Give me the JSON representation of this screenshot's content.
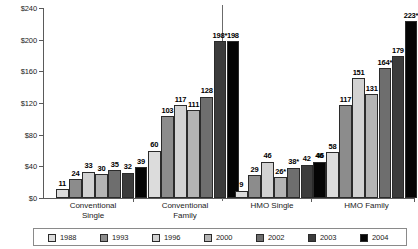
{
  "chart_data": {
    "type": "bar",
    "title": "",
    "xlabel": "",
    "ylabel": "",
    "ylim": [
      0,
      240
    ],
    "grid": false,
    "legend_position": "bottom",
    "y_ticks": [
      "$0",
      "$40",
      "$80",
      "$120",
      "$160",
      "$200",
      "$240"
    ],
    "y_tick_values": [
      0,
      40,
      80,
      120,
      160,
      200,
      240
    ],
    "categories": [
      "Conventional Single",
      "Conventional Family",
      "HMO Single",
      "HMO Family"
    ],
    "category_lines": [
      [
        "Conventional",
        "Single"
      ],
      [
        "Conventional",
        "Family"
      ],
      [
        "HMO Single"
      ],
      [
        "HMO Family"
      ]
    ],
    "series": [
      {
        "name": "1988",
        "color": "#dcdcdc",
        "values": [
          11,
          60,
          9,
          null
        ]
      },
      {
        "name": "1993",
        "color": "#8c8c8c",
        "values": [
          24,
          103,
          29,
          58
        ]
      },
      {
        "name": "1996",
        "color": "#d2d2d2",
        "values": [
          33,
          117,
          46,
          117
        ]
      },
      {
        "name": "2000",
        "color": "#b4b4b4",
        "values": [
          30,
          111,
          26,
          151
        ]
      },
      {
        "name": "2002",
        "color": "#6e6e6e",
        "values": [
          35,
          128,
          38,
          131
        ]
      },
      {
        "name": "2003",
        "color": "#3c3c3c",
        "values": [
          32,
          198,
          42,
          164
        ]
      },
      {
        "name": "2004",
        "color": "#050505",
        "values": [
          39,
          198,
          46,
          179
        ]
      }
    ],
    "extra_bars": [
      {
        "category": "HMO Family",
        "series": "1988",
        "value": 46,
        "label": "46",
        "color": "#050505"
      },
      {
        "category": "HMO Family",
        "series": "2004b",
        "value": 223,
        "label": "223*",
        "color": "#050505"
      }
    ],
    "data_labels": {
      "Conventional Single": [
        "11",
        "24",
        "33",
        "30",
        "35",
        "32",
        "39"
      ],
      "Conventional Family": [
        "60",
        "103",
        "117",
        "111",
        "128",
        "198*",
        "198"
      ],
      "HMO Single": [
        "9",
        "29",
        "46",
        "26*",
        "38*",
        "42",
        "46"
      ],
      "HMO Family": [
        "46",
        "58",
        "117",
        "151",
        "131",
        "164*",
        "179",
        "223*"
      ]
    }
  },
  "legend": {
    "items": [
      {
        "label": "1988",
        "color": "#dcdcdc"
      },
      {
        "label": "1993",
        "color": "#8c8c8c"
      },
      {
        "label": "1996",
        "color": "#d2d2d2"
      },
      {
        "label": "2000",
        "color": "#b4b4b4"
      },
      {
        "label": "2002",
        "color": "#6e6e6e"
      },
      {
        "label": "2003",
        "color": "#3c3c3c"
      },
      {
        "label": "2004",
        "color": "#050505"
      }
    ]
  },
  "axis": {
    "tick_0": "$0",
    "tick_40": "$40",
    "tick_80": "$80",
    "tick_120": "$120",
    "tick_160": "$160",
    "tick_200": "$200",
    "tick_240": "$240"
  },
  "groups": {
    "g0_line1": "Conventional",
    "g0_line2": "Single",
    "g1_line1": "Conventional",
    "g1_line2": "Family",
    "g2_line1": "HMO Single",
    "g3_line1": "HMO Family"
  },
  "bars": {
    "cs": [
      {
        "label": "11",
        "value": 11,
        "color": "#dcdcdc",
        "series": "1988"
      },
      {
        "label": "24",
        "value": 24,
        "color": "#8c8c8c",
        "series": "1993"
      },
      {
        "label": "33",
        "value": 33,
        "color": "#d2d2d2",
        "series": "1996"
      },
      {
        "label": "30",
        "value": 30,
        "color": "#b4b4b4",
        "series": "2000"
      },
      {
        "label": "35",
        "value": 35,
        "color": "#6e6e6e",
        "series": "2002"
      },
      {
        "label": "32",
        "value": 32,
        "color": "#3c3c3c",
        "series": "2003"
      },
      {
        "label": "39",
        "value": 39,
        "color": "#050505",
        "series": "2004"
      }
    ],
    "cf": [
      {
        "label": "60",
        "value": 60,
        "color": "#dcdcdc",
        "series": "1988"
      },
      {
        "label": "103",
        "value": 103,
        "color": "#8c8c8c",
        "series": "1993"
      },
      {
        "label": "117",
        "value": 117,
        "color": "#d2d2d2",
        "series": "1996"
      },
      {
        "label": "111",
        "value": 111,
        "color": "#b4b4b4",
        "series": "2000"
      },
      {
        "label": "128",
        "value": 128,
        "color": "#6e6e6e",
        "series": "2002"
      },
      {
        "label": "198*",
        "value": 198,
        "color": "#3c3c3c",
        "series": "2003"
      },
      {
        "label": "198",
        "value": 198,
        "color": "#050505",
        "series": "2004"
      }
    ],
    "hs": [
      {
        "label": "9",
        "value": 9,
        "color": "#dcdcdc",
        "series": "1988"
      },
      {
        "label": "29",
        "value": 29,
        "color": "#8c8c8c",
        "series": "1993"
      },
      {
        "label": "46",
        "value": 46,
        "color": "#d2d2d2",
        "series": "1996"
      },
      {
        "label": "26*",
        "value": 26,
        "color": "#b4b4b4",
        "series": "2000"
      },
      {
        "label": "38*",
        "value": 38,
        "color": "#6e6e6e",
        "series": "2002"
      },
      {
        "label": "42",
        "value": 42,
        "color": "#3c3c3c",
        "series": "2003"
      },
      {
        "label": "46",
        "value": 46,
        "color": "#050505",
        "series": "2004"
      }
    ],
    "hf": [
      {
        "label": "46",
        "value": 46,
        "color": "#050505",
        "series": "2004prev"
      },
      {
        "label": "58",
        "value": 58,
        "color": "#dcdcdc",
        "series": "1988"
      },
      {
        "label": "117",
        "value": 117,
        "color": "#8c8c8c",
        "series": "1993"
      },
      {
        "label": "151",
        "value": 151,
        "color": "#d2d2d2",
        "series": "1996"
      },
      {
        "label": "131",
        "value": 131,
        "color": "#b4b4b4",
        "series": "2000"
      },
      {
        "label": "164*",
        "value": 164,
        "color": "#6e6e6e",
        "series": "2002"
      },
      {
        "label": "179",
        "value": 179,
        "color": "#3c3c3c",
        "series": "2003"
      },
      {
        "label": "223*",
        "value": 223,
        "color": "#050505",
        "series": "2004"
      }
    ]
  }
}
